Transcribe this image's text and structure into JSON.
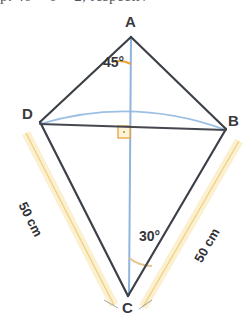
{
  "header": {
    "clipped_text": "p. 40 = 0 = 2, respectiv"
  },
  "figure": {
    "vertices": [
      {
        "id": "A",
        "label": "A",
        "x": 131,
        "y": 36,
        "label_x": 125,
        "label_y": 14
      },
      {
        "id": "B",
        "label": "B",
        "x": 226,
        "y": 129,
        "label_x": 228,
        "label_y": 113
      },
      {
        "id": "C",
        "label": "C",
        "x": 128,
        "y": 296,
        "label_x": 122,
        "label_y": 300
      },
      {
        "id": "D",
        "label": "D",
        "x": 40,
        "y": 122,
        "label_x": 22,
        "label_y": 106
      }
    ],
    "angles": [
      {
        "id": "angle-a",
        "label": "45°",
        "vertex": "A",
        "label_x": 103,
        "label_y": 55
      },
      {
        "id": "angle-c",
        "label": "30°",
        "vertex": "C",
        "label_x": 139,
        "label_y": 229
      }
    ],
    "sides": [
      {
        "id": "side-dc",
        "label": "50 cm",
        "from": "D",
        "to": "C",
        "label_x": 28,
        "label_y": 200,
        "rotation": 63
      },
      {
        "id": "side-bc",
        "label": "50 cm",
        "from": "B",
        "to": "C",
        "label_x": 192,
        "label_y": 258,
        "rotation": -60
      }
    ],
    "markers": {
      "right_angle": {
        "label": "right-angle-marker",
        "x": 118,
        "y": 126,
        "size": 12
      }
    },
    "colors": {
      "edge": "#3c4148",
      "diagonal_vertical": "#8fb4de",
      "arc_blue": "#9cc0e4",
      "angle_arc": "#e8a33d",
      "highlight_band": "#fbf0cf",
      "highlight_band_edge": "#f3c96a",
      "right_angle": "#e8a33d",
      "background": "#ffffff"
    }
  }
}
